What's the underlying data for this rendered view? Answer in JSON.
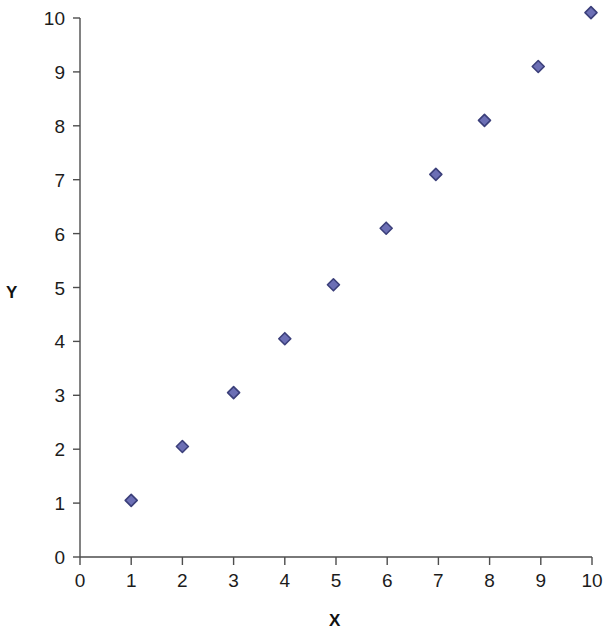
{
  "chart_data": {
    "type": "scatter",
    "title": "",
    "xlabel": "X",
    "ylabel": "Y",
    "xlim": [
      0,
      10
    ],
    "ylim": [
      0,
      10
    ],
    "xticks": [
      0,
      1,
      2,
      3,
      4,
      5,
      6,
      7,
      8,
      9,
      10
    ],
    "yticks": [
      0,
      1,
      2,
      3,
      4,
      5,
      6,
      7,
      8,
      9,
      10
    ],
    "xtick_labels": [
      "0",
      "1",
      "2",
      "3",
      "4",
      "5",
      "6",
      "7",
      "8",
      "9",
      "10"
    ],
    "ytick_labels": [
      "0",
      "1",
      "2",
      "3",
      "4",
      "5",
      "6",
      "7",
      "8",
      "9",
      "10"
    ],
    "grid": false,
    "legend": false,
    "series": [
      {
        "name": "Series 1",
        "marker": "diamond",
        "marker_fill": "#6c6fb5",
        "marker_edge": "#3b3f7a",
        "marker_size": 11,
        "points": [
          {
            "x": 1.0,
            "y": 1.05
          },
          {
            "x": 2.0,
            "y": 2.05
          },
          {
            "x": 3.0,
            "y": 3.05
          },
          {
            "x": 4.0,
            "y": 4.05
          },
          {
            "x": 4.95,
            "y": 5.05
          },
          {
            "x": 5.98,
            "y": 6.1
          },
          {
            "x": 6.95,
            "y": 7.1
          },
          {
            "x": 7.9,
            "y": 8.1
          },
          {
            "x": 8.95,
            "y": 9.1
          },
          {
            "x": 9.98,
            "y": 10.1
          }
        ]
      }
    ]
  },
  "axes": {
    "x_title": "X",
    "y_title": "Y",
    "axis_color": "#4d4d4d"
  },
  "colors": {
    "background": "#ffffff",
    "marker_fill": "#6c6fb5",
    "marker_edge": "#3b3f7a",
    "axis": "#4d4d4d",
    "text": "#1c1c1c"
  }
}
